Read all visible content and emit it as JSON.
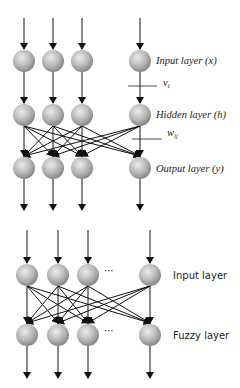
{
  "top_diagram": {
    "labels": {
      "input": "Input layer (x)",
      "hidden": "Hidden layer (h)",
      "output": "Output layer (y)",
      "v_main": "v",
      "v_sub": "i",
      "w_main": "w",
      "w_sub": "ij"
    },
    "columns_x": [
      24,
      53,
      82,
      140
    ],
    "rows_y": {
      "input": 61,
      "hidden": 115,
      "output": 168
    },
    "arrow_top_start_y": 18,
    "arrow_bottom_end_y": 210
  },
  "bottom_diagram": {
    "labels": {
      "input": "Input layer",
      "fuzzy": "Fuzzy layer",
      "ellipsis": "···"
    },
    "columns_x": [
      27,
      58,
      88,
      150
    ],
    "rows_y": {
      "input": 275,
      "fuzzy": 335
    },
    "arrow_top_start_y": 230,
    "arrow_bottom_end_y": 378
  },
  "colors": {
    "node_light": "#e6e6e6",
    "node_dark": "#8a8a8a",
    "line": "#111111"
  }
}
